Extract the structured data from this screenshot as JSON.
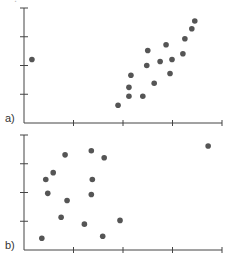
{
  "chart_data": [
    {
      "type": "scatter",
      "panel_label": "a)",
      "title": "",
      "xlabel": "",
      "ylabel": "",
      "xlim": [
        0,
        4
      ],
      "ylim": [
        0,
        4
      ],
      "xticks": [
        0,
        1,
        2,
        3,
        4
      ],
      "yticks": [
        1,
        2,
        3,
        4
      ],
      "tick_labels_visible": false,
      "grid": false,
      "points": [
        {
          "x": 0.16,
          "y": 2.21
        },
        {
          "x": 1.9,
          "y": 0.62
        },
        {
          "x": 2.12,
          "y": 0.93
        },
        {
          "x": 2.12,
          "y": 1.24
        },
        {
          "x": 2.16,
          "y": 1.66
        },
        {
          "x": 2.4,
          "y": 0.93
        },
        {
          "x": 2.48,
          "y": 2.0
        },
        {
          "x": 2.5,
          "y": 2.52
        },
        {
          "x": 2.63,
          "y": 1.38
        },
        {
          "x": 2.75,
          "y": 2.14
        },
        {
          "x": 2.87,
          "y": 2.72
        },
        {
          "x": 2.95,
          "y": 1.72
        },
        {
          "x": 2.99,
          "y": 2.21
        },
        {
          "x": 3.21,
          "y": 2.41
        },
        {
          "x": 3.25,
          "y": 2.93
        },
        {
          "x": 3.39,
          "y": 3.28
        },
        {
          "x": 3.45,
          "y": 3.55
        }
      ]
    },
    {
      "type": "scatter",
      "panel_label": "b)",
      "title": "",
      "xlabel": "",
      "ylabel": "",
      "xlim": [
        0,
        4
      ],
      "ylim": [
        0,
        4
      ],
      "xticks": [
        0,
        1,
        2,
        3,
        4
      ],
      "yticks": [
        1,
        2,
        3,
        4
      ],
      "tick_labels_visible": false,
      "grid": false,
      "points": [
        {
          "x": 0.36,
          "y": 0.41
        },
        {
          "x": 0.44,
          "y": 2.45
        },
        {
          "x": 0.48,
          "y": 1.97
        },
        {
          "x": 0.59,
          "y": 2.69
        },
        {
          "x": 0.75,
          "y": 1.14
        },
        {
          "x": 0.83,
          "y": 3.31
        },
        {
          "x": 0.87,
          "y": 1.72
        },
        {
          "x": 1.22,
          "y": 0.9
        },
        {
          "x": 1.36,
          "y": 3.45
        },
        {
          "x": 1.36,
          "y": 1.93
        },
        {
          "x": 1.38,
          "y": 2.45
        },
        {
          "x": 1.59,
          "y": 0.48
        },
        {
          "x": 1.62,
          "y": 3.21
        },
        {
          "x": 1.94,
          "y": 1.03
        },
        {
          "x": 3.72,
          "y": 3.62
        }
      ]
    }
  ],
  "style": {
    "point_color": "#555555",
    "axis_color": "#444444",
    "label_color": "#333333"
  }
}
